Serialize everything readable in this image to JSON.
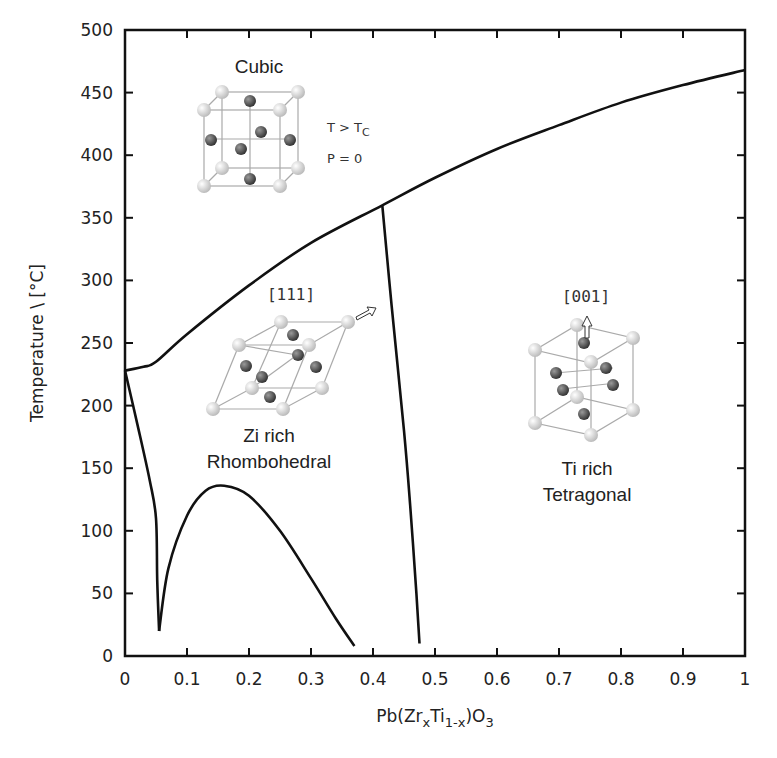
{
  "chart_data": {
    "type": "line",
    "title": "",
    "xlabel": "Pb(ZrxTi1-x)O3",
    "xlabel_parts": {
      "pre": "Pb(Zr",
      "sub1": "x",
      "mid": "Ti",
      "sub2": "1-x",
      "post": ")O",
      "sub3": "3"
    },
    "ylabel": "Temperature \\ [°C]",
    "xlim": [
      0,
      1
    ],
    "ylim": [
      0,
      500
    ],
    "grid": false,
    "legend": null,
    "x_ticks": [
      "0",
      "0.1",
      "0.2",
      "0.3",
      "0.4",
      "0.5",
      "0.6",
      "0.7",
      "0.8",
      "0.9",
      "1"
    ],
    "y_ticks": [
      "0",
      "50",
      "100",
      "150",
      "200",
      "250",
      "300",
      "350",
      "400",
      "450",
      "500"
    ],
    "series": [
      {
        "name": "Cubic phase boundary (Tc)",
        "x": [
          0,
          0.03,
          0.05,
          0.1,
          0.2,
          0.3,
          0.415,
          0.5,
          0.6,
          0.7,
          0.8,
          0.9,
          1.0
        ],
        "y": [
          228,
          231,
          235,
          257,
          296,
          330,
          360,
          382,
          405,
          424,
          442,
          456,
          468
        ]
      },
      {
        "name": "Rhombohedral-Tetragonal boundary (MPB)",
        "x": [
          0.415,
          0.43,
          0.45,
          0.46,
          0.47,
          0.475
        ],
        "y": [
          360,
          280,
          180,
          120,
          50,
          10
        ]
      },
      {
        "name": "Rhombohedral low-temperature boundary (left)",
        "x": [
          0,
          0.02,
          0.04,
          0.05,
          0.052,
          0.055
        ],
        "y": [
          228,
          185,
          140,
          110,
          60,
          20
        ]
      },
      {
        "name": "Rhombohedral low-temperature dome",
        "x": [
          0.055,
          0.07,
          0.1,
          0.13,
          0.16,
          0.2,
          0.25,
          0.3,
          0.34,
          0.37
        ],
        "y": [
          20,
          70,
          112,
          132,
          136,
          128,
          100,
          62,
          30,
          8
        ]
      }
    ],
    "annotations": [
      {
        "text": "Cubic",
        "region": "upper-left"
      },
      {
        "text": "T > TC",
        "region": "upper-left"
      },
      {
        "text": "P = 0",
        "region": "upper-left"
      },
      {
        "text": "[111]",
        "region": "rhombohedral"
      },
      {
        "text": "Zi rich",
        "region": "rhombohedral"
      },
      {
        "text": "Rhombohedral",
        "region": "rhombohedral"
      },
      {
        "text": "[001]",
        "region": "tetragonal"
      },
      {
        "text": "Ti rich",
        "region": "tetragonal"
      },
      {
        "text": "Tetragonal",
        "region": "tetragonal"
      }
    ]
  },
  "labels": {
    "cubic": "Cubic",
    "cond_t_pre": "T > T",
    "cond_t_sub": "C",
    "cond_p": "P = 0",
    "dir_111": "[111]",
    "rhombo_line1": "Zi rich",
    "rhombo_line2": "Rhombohedral",
    "dir_001": "[001]",
    "tetra_line1": "Ti rich",
    "tetra_line2": "Tetragonal"
  },
  "colors": {
    "line": "#111111",
    "axis": "#111111",
    "atom_light": "#d9d9d9",
    "atom_dark": "#555555",
    "cell_edge": "#aaaaaa"
  }
}
